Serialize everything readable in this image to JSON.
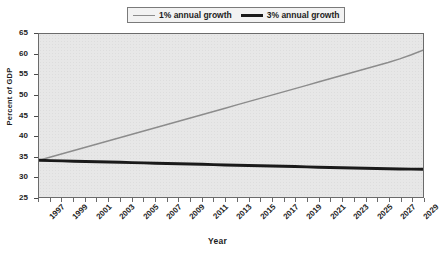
{
  "chart_data": {
    "type": "line",
    "title": "",
    "xlabel": "Year",
    "ylabel": "Percent of GDP",
    "ylim": [
      25,
      65
    ],
    "ytick_step": 5,
    "yticks": [
      25,
      30,
      35,
      40,
      45,
      50,
      55,
      60,
      65
    ],
    "xlim": [
      1997,
      2030
    ],
    "x": [
      1997,
      1998,
      1999,
      2000,
      2001,
      2002,
      2003,
      2004,
      2005,
      2006,
      2007,
      2008,
      2009,
      2010,
      2011,
      2012,
      2013,
      2014,
      2015,
      2016,
      2017,
      2018,
      2019,
      2020,
      2021,
      2022,
      2023,
      2024,
      2025,
      2026,
      2027,
      2028,
      2029,
      2030
    ],
    "xtick_labels": [
      "1997",
      "1999",
      "2001",
      "2003",
      "2005",
      "2007",
      "2009",
      "2011",
      "2013",
      "2015",
      "2017",
      "2019",
      "2021",
      "2023",
      "2025",
      "2027",
      "2029"
    ],
    "xtick_label_step": 2,
    "grid": false,
    "legend_position": "top-center",
    "series": [
      {
        "name": "1% annual growth",
        "color": "#8c8c8c",
        "width": 1.5,
        "values": [
          34.0,
          34.8,
          35.6,
          36.4,
          37.2,
          38.0,
          38.8,
          39.6,
          40.4,
          41.2,
          42.0,
          42.8,
          43.6,
          44.4,
          45.2,
          46.0,
          46.8,
          47.6,
          48.4,
          49.2,
          50.0,
          50.8,
          51.6,
          52.4,
          53.2,
          54.0,
          54.8,
          55.6,
          56.4,
          57.2,
          58.0,
          58.9,
          59.9,
          61.0
        ]
      },
      {
        "name": "3% annual growth",
        "color": "#1a1a1a",
        "width": 3,
        "values": [
          34.0,
          33.93,
          33.86,
          33.79,
          33.72,
          33.65,
          33.58,
          33.51,
          33.44,
          33.37,
          33.3,
          33.23,
          33.16,
          33.09,
          33.02,
          32.95,
          32.88,
          32.81,
          32.74,
          32.67,
          32.6,
          32.53,
          32.46,
          32.39,
          32.32,
          32.25,
          32.18,
          32.11,
          32.04,
          31.99,
          31.94,
          31.89,
          31.84,
          31.8
        ]
      }
    ]
  },
  "legend": {
    "entries": [
      {
        "label": "1% annual growth"
      },
      {
        "label": "3% annual growth"
      }
    ]
  },
  "axes": {
    "x_title": "Year",
    "y_title": "Percent of GDP"
  },
  "colors": {
    "series_1": "#8c8c8c",
    "series_2": "#1a1a1a",
    "plot_background": "#e7e7e7",
    "page_background": "#ffffff",
    "axis": "#6b6b6b",
    "text": "#1d1d1d"
  }
}
